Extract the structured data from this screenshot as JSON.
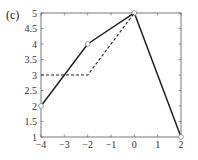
{
  "panel_label": "(c)",
  "chart_data": {
    "type": "line",
    "title": "",
    "xlabel": "",
    "ylabel": "",
    "xlim": [
      -4,
      2
    ],
    "ylim": [
      1,
      5
    ],
    "grid": false,
    "legend": null,
    "x_ticks": [
      -4,
      -3,
      -2,
      -1,
      0,
      1,
      2
    ],
    "x_tick_labels": [
      "−4",
      "−3",
      "−2",
      "−1",
      "0",
      "1",
      "2"
    ],
    "y_ticks": [
      1,
      1.5,
      2,
      2.5,
      3,
      3.5,
      4,
      4.5,
      5
    ],
    "y_tick_labels": [
      "1",
      "1.5",
      "2",
      "2.5",
      "3",
      "3.5",
      "4",
      "4.5",
      "5"
    ],
    "series": [
      {
        "name": "solid",
        "style": "solid",
        "marker": "circle",
        "color": "#222222",
        "x": [
          -4,
          -2,
          0,
          2
        ],
        "y": [
          2,
          4,
          5,
          1
        ]
      },
      {
        "name": "dashed",
        "style": "dashed",
        "marker": "none",
        "color": "#222222",
        "x": [
          -4,
          -2,
          0
        ],
        "y": [
          3,
          3,
          5
        ]
      }
    ]
  },
  "plot_box": {
    "left": 41,
    "top": 13,
    "right": 181,
    "bottom": 137
  }
}
